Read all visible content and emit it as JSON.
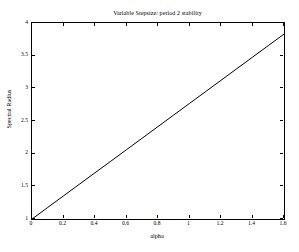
{
  "chart_data": {
    "type": "line",
    "title": "Variable Stepsize: period 2 stability",
    "xlabel": "alpha",
    "ylabel": "Spectral Radius",
    "xlim": [
      0,
      1.6
    ],
    "ylim": [
      1,
      4
    ],
    "xticks": [
      0,
      0.2,
      0.4,
      0.6,
      0.8,
      1,
      1.2,
      1.4,
      1.6
    ],
    "xticklabels": [
      "0",
      "0.2",
      "0.4",
      "0.6",
      "0.8",
      "1",
      "1.2",
      "1.4",
      "1.6"
    ],
    "yticks": [
      1,
      1.5,
      2,
      2.5,
      3,
      3.5,
      4
    ],
    "yticklabels": [
      "1",
      "1.5",
      "2",
      "2.5",
      "3",
      "3.5",
      "4"
    ],
    "grid": false,
    "legend": null,
    "line_color": "#000000",
    "line_width": 1,
    "series": [
      {
        "name": "spectral radius",
        "x": [
          0,
          0.1,
          0.2,
          0.3,
          0.4,
          0.5,
          0.6,
          0.7,
          0.8,
          0.9,
          1.0,
          1.1,
          1.2,
          1.3,
          1.4,
          1.5,
          1.6
        ],
        "y": [
          1.0,
          1.177,
          1.354,
          1.531,
          1.708,
          1.884,
          2.061,
          2.238,
          2.415,
          2.592,
          2.769,
          2.946,
          3.123,
          3.3,
          3.477,
          3.654,
          3.83
        ]
      }
    ]
  }
}
